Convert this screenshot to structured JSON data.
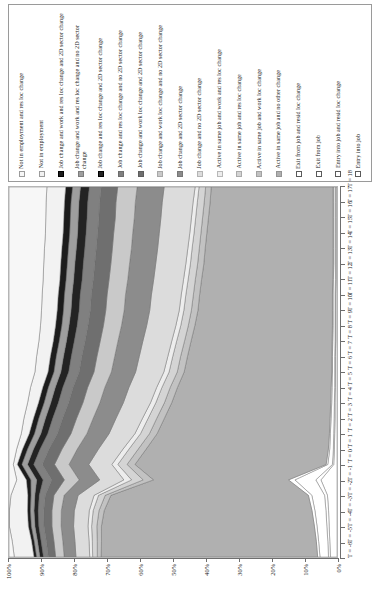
{
  "legend": {
    "items": [
      {
        "label": "Not in employment and res loc change",
        "color": "#f7f7f7",
        "border": "#9b9b9b"
      },
      {
        "label": "Not in employment",
        "color": "#f2f2f2",
        "border": "#9b9b9b"
      },
      {
        "label": "Job change and work and res loc change and 2D sector change",
        "color": "#1c1c1c",
        "border": "#000000"
      },
      {
        "label": "Job change and work and res loc change and no 2D sector change",
        "color": "#9e9e9e",
        "border": "#7d7d7d"
      },
      {
        "label": "Job change and res loc change and 2D sector change",
        "color": "#232323",
        "border": "#000000"
      },
      {
        "label": "Job change and res loc change and no 2D sector change",
        "color": "#808080",
        "border": "#6d6d6d"
      },
      {
        "label": "Job change and work loc change and 2D sector change",
        "color": "#6f6f6f",
        "border": "#5e5e5e"
      },
      {
        "label": "Job change and work loc change and no 2D sector change",
        "color": "#c9c9c9",
        "border": "#a8a8a8"
      },
      {
        "label": "Job change and 2D sector change",
        "color": "#8c8c8c",
        "border": "#777777"
      },
      {
        "label": "Job change and no 2D sector change",
        "color": "#dcdcdc",
        "border": "#b4b4b4"
      },
      {
        "label": "Active in same job and work and res loc change",
        "color": "#ededed",
        "border": "#b8b8b8"
      },
      {
        "label": "Active in same job and res loc change",
        "color": "#d4d4d4",
        "border": "#ababab"
      },
      {
        "label": "Active in same job and work loc change",
        "color": "#c2c2c2",
        "border": "#a2a2a2"
      },
      {
        "label": "Active in same job and no other change",
        "color": "#b0b0b0",
        "border": "#949494"
      },
      {
        "label": "Exit from job and resid loc change",
        "color": "#ffffff",
        "border": "#5a5a5a"
      },
      {
        "label": "Exit from job",
        "color": "#ffffff",
        "border": "#5a5a5a"
      },
      {
        "label": "Entry into job and resid loc change",
        "color": "#ffffff",
        "border": "#5a5a5a"
      },
      {
        "label": "Entry into job",
        "color": "#ffffff",
        "border": "#5a5a5a"
      }
    ]
  },
  "chart_data": {
    "type": "area",
    "title": "",
    "xlabel": "",
    "ylabel": "",
    "stacked": true,
    "normalized": "100%",
    "grid": false,
    "legend_position": "top",
    "ylim": [
      0,
      100
    ],
    "yticks": [
      "0%",
      "10%",
      "20%",
      "30%",
      "40%",
      "50%",
      "60%",
      "70%",
      "80%",
      "90%",
      "100%"
    ],
    "x": [
      "T = -6",
      "T = -5",
      "T = -4",
      "T = -3",
      "T = -2",
      "T = -1",
      "T = 0",
      "T = 1",
      "T = 2",
      "T = 3",
      "T = 4",
      "T = 5",
      "T = 6",
      "T = 7",
      "T = 8",
      "T = 9",
      "T = 10",
      "T = 11",
      "T = 12",
      "T = 13",
      "T = 14",
      "T = 15",
      "T = 16",
      "T = 17",
      "T = 18"
    ],
    "series": [
      {
        "name": "Entry into job",
        "color": "#ffffff",
        "values": [
          2.0,
          2.2,
          2.4,
          2.6,
          3.0,
          5.0,
          1.0,
          0.8,
          0.7,
          0.6,
          0.6,
          0.5,
          0.5,
          0.5,
          0.4,
          0.4,
          0.4,
          0.4,
          0.3,
          0.3,
          0.3,
          0.3,
          0.3,
          0.3,
          0.3
        ]
      },
      {
        "name": "Entry into job and resid loc change",
        "color": "#ffffff",
        "values": [
          0.6,
          0.6,
          0.7,
          0.8,
          0.9,
          1.6,
          0.4,
          0.3,
          0.3,
          0.3,
          0.2,
          0.2,
          0.2,
          0.2,
          0.2,
          0.2,
          0.2,
          0.2,
          0.2,
          0.2,
          0.2,
          0.2,
          0.2,
          0.2,
          0.2
        ]
      },
      {
        "name": "Exit from job",
        "color": "#ffffff",
        "values": [
          2.6,
          2.8,
          3.0,
          3.4,
          4.0,
          6.5,
          1.4,
          1.1,
          1.0,
          0.9,
          0.8,
          0.8,
          0.7,
          0.7,
          0.7,
          0.6,
          0.6,
          0.6,
          0.6,
          0.5,
          0.5,
          0.5,
          0.5,
          0.5,
          0.5
        ]
      },
      {
        "name": "Exit from job and resid loc change",
        "color": "#ffffff",
        "values": [
          0.7,
          0.7,
          0.8,
          0.9,
          1.1,
          2.0,
          0.5,
          0.4,
          0.3,
          0.3,
          0.3,
          0.3,
          0.2,
          0.2,
          0.2,
          0.2,
          0.2,
          0.2,
          0.2,
          0.2,
          0.2,
          0.2,
          0.2,
          0.2,
          0.2
        ]
      },
      {
        "name": "Active in same job and no other change",
        "color": "#b0b0b0",
        "values": [
          66.0,
          65.5,
          65.0,
          64.0,
          62.0,
          42.0,
          58.0,
          55.0,
          52.0,
          50.0,
          48.0,
          46.5,
          45.0,
          44.0,
          43.0,
          42.0,
          41.0,
          40.5,
          40.0,
          39.5,
          39.0,
          38.5,
          38.0,
          37.5,
          37.0
        ]
      },
      {
        "name": "Active in same job and work loc change",
        "color": "#c2c2c2",
        "values": [
          1.2,
          1.3,
          1.4,
          1.6,
          1.8,
          3.2,
          2.4,
          2.4,
          2.3,
          2.3,
          2.2,
          2.2,
          2.1,
          2.1,
          2.0,
          2.0,
          2.0,
          1.9,
          1.9,
          1.9,
          1.8,
          1.8,
          1.8,
          1.8,
          1.7
        ]
      },
      {
        "name": "Active in same job and res loc change",
        "color": "#d4d4d4",
        "values": [
          1.4,
          1.5,
          1.6,
          1.8,
          2.1,
          3.6,
          2.8,
          2.8,
          2.7,
          2.6,
          2.6,
          2.5,
          2.5,
          2.4,
          2.4,
          2.3,
          2.3,
          2.3,
          2.2,
          2.2,
          2.2,
          2.1,
          2.1,
          2.1,
          2.0
        ]
      },
      {
        "name": "Active in same job and work and res loc change",
        "color": "#ededed",
        "values": [
          0.9,
          1.0,
          1.1,
          1.2,
          1.4,
          2.4,
          1.8,
          1.8,
          1.7,
          1.7,
          1.6,
          1.6,
          1.6,
          1.5,
          1.5,
          1.5,
          1.4,
          1.4,
          1.4,
          1.4,
          1.3,
          1.3,
          1.3,
          1.3,
          1.2
        ]
      },
      {
        "name": "Job change and no 2D sector change",
        "color": "#dcdcdc",
        "values": [
          4.2,
          4.3,
          4.4,
          4.6,
          5.0,
          7.5,
          7.0,
          7.4,
          7.8,
          8.0,
          8.2,
          8.4,
          8.6,
          8.7,
          8.8,
          8.9,
          9.0,
          9.1,
          9.1,
          9.2,
          9.2,
          9.3,
          9.3,
          9.4,
          9.4
        ]
      },
      {
        "name": "Job change and 2D sector change",
        "color": "#8c8c8c",
        "values": [
          3.6,
          3.7,
          3.8,
          4.0,
          4.4,
          6.4,
          6.0,
          6.4,
          6.7,
          6.9,
          7.1,
          7.3,
          7.4,
          7.5,
          7.6,
          7.7,
          7.8,
          7.9,
          7.9,
          8.0,
          8.0,
          8.1,
          8.1,
          8.2,
          8.2
        ]
      },
      {
        "name": "Job change and work loc change and no 2D sector change",
        "color": "#c9c9c9",
        "values": [
          2.6,
          2.7,
          2.8,
          2.9,
          3.2,
          4.6,
          4.4,
          4.6,
          4.8,
          5.0,
          5.1,
          5.2,
          5.3,
          5.4,
          5.4,
          5.5,
          5.6,
          5.6,
          5.7,
          5.7,
          5.8,
          5.8,
          5.8,
          5.9,
          5.9
        ]
      },
      {
        "name": "Job change and work loc change and 2D sector change",
        "color": "#6f6f6f",
        "values": [
          2.2,
          2.3,
          2.4,
          2.5,
          2.7,
          3.9,
          3.7,
          3.9,
          4.1,
          4.2,
          4.3,
          4.4,
          4.5,
          4.6,
          4.6,
          4.7,
          4.7,
          4.8,
          4.8,
          4.9,
          4.9,
          4.9,
          5.0,
          5.0,
          5.0
        ]
      },
      {
        "name": "Job change and res loc change and no 2D sector change",
        "color": "#808080",
        "values": [
          1.5,
          1.6,
          1.6,
          1.7,
          1.9,
          2.7,
          2.6,
          2.7,
          2.9,
          3.0,
          3.1,
          3.1,
          3.2,
          3.2,
          3.3,
          3.3,
          3.4,
          3.4,
          3.4,
          3.5,
          3.5,
          3.5,
          3.6,
          3.6,
          3.6
        ]
      },
      {
        "name": "Job change and res loc change and 2D sector change",
        "color": "#232323",
        "values": [
          1.1,
          1.1,
          1.2,
          1.3,
          1.4,
          2.0,
          1.9,
          2.0,
          2.1,
          2.2,
          2.3,
          2.3,
          2.4,
          2.4,
          2.4,
          2.5,
          2.5,
          2.5,
          2.6,
          2.6,
          2.6,
          2.6,
          2.7,
          2.7,
          2.7
        ]
      },
      {
        "name": "Job change and work and res loc change and no 2D sector change",
        "color": "#9e9e9e",
        "values": [
          1.0,
          1.0,
          1.1,
          1.1,
          1.2,
          1.8,
          1.7,
          1.8,
          1.9,
          2.0,
          2.0,
          2.1,
          2.1,
          2.2,
          2.2,
          2.2,
          2.3,
          2.3,
          2.3,
          2.3,
          2.4,
          2.4,
          2.4,
          2.4,
          2.4
        ]
      },
      {
        "name": "Job change and work and res loc change and 2D sector change",
        "color": "#1c1c1c",
        "values": [
          0.8,
          0.8,
          0.9,
          0.9,
          1.0,
          1.4,
          1.4,
          1.5,
          1.6,
          1.6,
          1.7,
          1.7,
          1.8,
          1.8,
          1.8,
          1.9,
          1.9,
          1.9,
          1.9,
          2.0,
          2.0,
          2.0,
          2.0,
          2.0,
          2.1
        ]
      },
      {
        "name": "Not in employment",
        "color": "#f2f2f2",
        "values": [
          6.0,
          5.9,
          5.8,
          5.6,
          5.3,
          3.0,
          1.2,
          1.8,
          2.4,
          2.9,
          3.3,
          3.7,
          4.0,
          4.2,
          4.4,
          4.6,
          4.8,
          4.9,
          5.1,
          5.2,
          5.3,
          5.4,
          5.5,
          5.6,
          5.7
        ]
      },
      {
        "name": "Not in employment and res loc change",
        "color": "#f7f7f7",
        "values": [
          1.6,
          1.0,
          0.1,
          0.1,
          0.6,
          2.4,
          1.3,
          2.3,
          3.7,
          4.5,
          5.6,
          6.5,
          7.9,
          8.4,
          9.1,
          9.6,
          9.9,
          10.1,
          10.4,
          10.6,
          10.8,
          11.1,
          11.2,
          11.3,
          11.5
        ]
      }
    ]
  }
}
